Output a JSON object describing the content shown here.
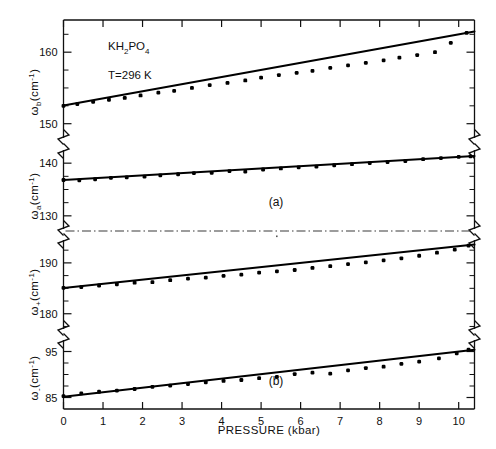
{
  "figure": {
    "annotations": {
      "compound": "KH2PO4",
      "compound_parts": {
        "k": "KH",
        "sub2": "2",
        "po": "PO",
        "sub4": "4"
      },
      "temperature": "T=296  K",
      "panel_a_label": "(a)",
      "panel_b_label": "(b)"
    },
    "xaxis": {
      "label": "PRESSURE  (kbar)",
      "ticklabels": [
        "0",
        "1",
        "2",
        "3",
        "4",
        "5",
        "6",
        "7",
        "8",
        "9",
        "10"
      ],
      "min": 0,
      "max": 10.4
    },
    "colors": {
      "ink": "#101010",
      "data": "#000000",
      "divider": "#3a3a3a",
      "background": "#ffffff"
    }
  },
  "chart_data": [
    {
      "type": "scatter",
      "panel": "omega_b",
      "title": "KH2PO4  T=296 K",
      "xlabel": "PRESSURE (kbar)",
      "ylabel": "ω_b (cm^-1)",
      "ylabel_parts": {
        "omega": "ω",
        "subscript": "b",
        "unit": "(cm",
        "exp": "-1",
        "close": ")"
      },
      "ylim": [
        148.0,
        164.5
      ],
      "yticks": [
        150,
        160
      ],
      "yticklabels": [
        "150",
        "160"
      ],
      "yminor_step": 2.5,
      "xlim": [
        0,
        10.4
      ],
      "grid": false,
      "legend": false,
      "x": [
        0.0,
        0.35,
        0.75,
        1.15,
        1.55,
        1.95,
        2.4,
        2.8,
        3.25,
        3.7,
        4.15,
        4.6,
        5.0,
        5.45,
        5.9,
        6.3,
        6.75,
        7.2,
        7.65,
        8.1,
        8.5,
        8.95,
        9.4,
        9.8,
        10.2
      ],
      "y": [
        152.5,
        152.75,
        153.05,
        153.35,
        153.6,
        153.95,
        154.35,
        154.6,
        155.0,
        155.4,
        155.7,
        156.05,
        156.45,
        156.8,
        157.1,
        157.4,
        157.8,
        158.15,
        158.5,
        158.85,
        159.25,
        159.6,
        160.0,
        161.3,
        162.7
      ],
      "fit_line": {
        "x": [
          0,
          10.4
        ],
        "y": [
          152.55,
          162.9
        ],
        "slope_per_kbar": 0.995
      }
    },
    {
      "type": "scatter",
      "panel": "omega_a",
      "xlabel": "PRESSURE (kbar)",
      "ylabel": "ω_a (cm^-1)",
      "ylabel_parts": {
        "omega": "ω",
        "subscript": "a",
        "unit": "(cm",
        "exp": "-1",
        "close": ")"
      },
      "ylim": [
        127.5,
        142.5
      ],
      "yticks": [
        130,
        140
      ],
      "yticklabels": [
        "130",
        "140"
      ],
      "yminor_step": 2.5,
      "xlim": [
        0,
        10.4
      ],
      "grid": false,
      "legend": false,
      "x": [
        0.0,
        0.4,
        0.8,
        1.2,
        1.6,
        2.05,
        2.45,
        2.9,
        3.3,
        3.75,
        4.2,
        4.6,
        5.05,
        5.5,
        5.95,
        6.4,
        6.85,
        7.3,
        7.75,
        8.2,
        8.65,
        9.1,
        9.55,
        10.0,
        10.3
      ],
      "y": [
        136.8,
        136.75,
        136.95,
        137.2,
        137.3,
        137.45,
        137.7,
        137.9,
        138.1,
        138.15,
        138.5,
        138.4,
        138.8,
        139.0,
        139.2,
        139.35,
        139.6,
        139.8,
        140.0,
        140.2,
        140.4,
        140.75,
        140.95,
        141.2,
        141.3
      ],
      "fit_line": {
        "x": [
          0,
          10.4
        ],
        "y": [
          136.8,
          141.35
        ],
        "slope_per_kbar": 0.438
      }
    },
    {
      "type": "scatter",
      "panel": "omega_plus",
      "xlabel": "PRESSURE (kbar)",
      "ylabel": "ω_+ (cm^-1)",
      "ylabel_parts": {
        "omega": "ω",
        "subscript": "+",
        "unit": "(cm",
        "exp": "-1",
        "close": ")"
      },
      "ylim": [
        177.0,
        194.5
      ],
      "yticks": [
        180,
        190
      ],
      "yticklabels": [
        "180",
        "190"
      ],
      "yminor_step": 2.5,
      "xlim": [
        0,
        10.4
      ],
      "grid": false,
      "legend": false,
      "x": [
        0.0,
        0.45,
        0.9,
        1.35,
        1.8,
        2.25,
        2.7,
        3.15,
        3.6,
        4.05,
        4.5,
        4.95,
        5.4,
        5.85,
        6.3,
        6.75,
        7.2,
        7.65,
        8.1,
        8.55,
        9.0,
        9.45,
        9.9,
        10.25
      ],
      "y": [
        185.1,
        185.25,
        185.55,
        185.8,
        186.1,
        186.2,
        186.6,
        186.9,
        187.1,
        187.45,
        187.7,
        188.1,
        188.35,
        188.6,
        189.0,
        189.35,
        189.75,
        190.1,
        190.5,
        190.9,
        191.4,
        192.0,
        192.6,
        193.4
      ],
      "fit_line": {
        "x": [
          0,
          10.4
        ],
        "y": [
          185.05,
          193.6
        ],
        "slope_per_kbar": 0.822
      }
    },
    {
      "type": "scatter",
      "panel": "omega_minus",
      "xlabel": "PRESSURE (kbar)",
      "ylabel": "ω_- (cm^-1)",
      "ylabel_parts": {
        "omega": "ω",
        "subscript": "-",
        "unit": "(cm",
        "exp": "-1",
        "close": ")"
      },
      "ylim": [
        82.5,
        97.5
      ],
      "yticks": [
        85,
        95
      ],
      "yticklabels": [
        "85",
        "95"
      ],
      "yminor_step": 2.5,
      "xlim": [
        0,
        10.4
      ],
      "grid": false,
      "legend": false,
      "x": [
        0.0,
        0.45,
        0.9,
        1.35,
        1.8,
        2.25,
        2.7,
        3.15,
        3.6,
        4.05,
        4.5,
        4.95,
        5.4,
        5.85,
        6.3,
        6.75,
        7.2,
        7.65,
        8.1,
        8.55,
        9.0,
        9.5,
        9.95,
        10.25
      ],
      "y": [
        85.3,
        85.9,
        86.25,
        86.5,
        86.85,
        87.3,
        87.6,
        87.9,
        88.3,
        88.6,
        88.8,
        89.2,
        89.5,
        90.1,
        90.4,
        90.2,
        90.9,
        91.4,
        91.7,
        92.3,
        92.8,
        93.5,
        94.6,
        95.4
      ],
      "fit_line": {
        "x": [
          0,
          10.4
        ],
        "y": [
          85.15,
          95.4
        ],
        "slope_per_kbar": 0.986
      }
    }
  ]
}
